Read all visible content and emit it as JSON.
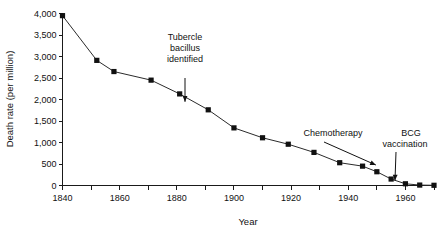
{
  "chart_data": {
    "type": "line",
    "title": "",
    "xlabel": "Year",
    "ylabel": "Death rate (per million)",
    "xlim": [
      1840,
      1970
    ],
    "ylim": [
      0,
      4000
    ],
    "grid": false,
    "legend": "none",
    "x_tick_labels": [
      "1840",
      "1860",
      "1880",
      "1900",
      "1920",
      "1940",
      "1960"
    ],
    "x_tick_values": [
      1840,
      1860,
      1880,
      1900,
      1920,
      1940,
      1960
    ],
    "x_minor_ticks": [
      1850,
      1870,
      1890,
      1910,
      1930,
      1950,
      1970
    ],
    "y_tick_labels": [
      "0",
      "500",
      "1,000",
      "1,500",
      "2,000",
      "2,500",
      "3,000",
      "3,500",
      "4,000"
    ],
    "y_tick_values": [
      0,
      500,
      1000,
      1500,
      2000,
      2500,
      3000,
      3500,
      4000
    ],
    "series": [
      {
        "name": "Tuberculosis death rate",
        "marker": "square",
        "color": "#111111",
        "x": [
          1840,
          1852,
          1858,
          1871,
          1881,
          1891,
          1900,
          1910,
          1919,
          1928,
          1937,
          1945,
          1950,
          1955,
          1960,
          1965,
          1970
        ],
        "values": [
          3950,
          2910,
          2650,
          2450,
          2130,
          1760,
          1340,
          1110,
          960,
          770,
          530,
          450,
          320,
          150,
          40,
          10,
          5
        ]
      }
    ],
    "annotations": [
      {
        "id": "tubercle-bacillus",
        "lines": [
          "Tubercle",
          "bacillus",
          "identified"
        ],
        "text": "Tubercle bacillus identified",
        "target_x": 1887,
        "target_y": 1900,
        "arrow_direction": "down"
      },
      {
        "id": "chemotherapy",
        "lines": [
          "Chemotherapy"
        ],
        "text": "Chemotherapy",
        "target_x": 1950,
        "target_y": 430,
        "arrow_direction": "down-right"
      },
      {
        "id": "bcg-vaccination",
        "lines": [
          "BCG",
          "vaccination"
        ],
        "text": "BCG vaccination",
        "target_x": 1956,
        "target_y": 140,
        "arrow_direction": "down-left"
      }
    ]
  }
}
